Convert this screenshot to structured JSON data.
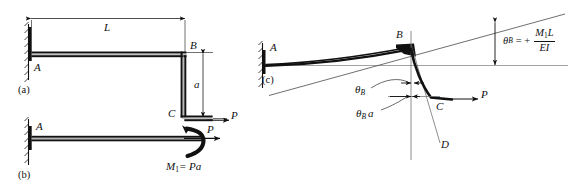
{
  "figure": {
    "kind": "engineering-beam-deflection-diagram",
    "background_color": "#ffffff",
    "ink_color": "#111111",
    "thin_color": "#6a6a6a"
  },
  "panels": [
    {
      "id": "a",
      "label": "(a)"
    },
    {
      "id": "b",
      "label": "(b)"
    },
    {
      "id": "c",
      "label": "(c)"
    }
  ],
  "panel_a": {
    "label": "(a)",
    "support_label": "A",
    "corner_label": "B",
    "tip_label": "C",
    "span_dimension": "L",
    "height_dimension": "a",
    "force_label": "P"
  },
  "panel_b": {
    "label": "(b)",
    "support_label": "A",
    "force_label": "P",
    "moment_label_main": "M",
    "moment_label_sub": "1",
    "moment_label_rest": "= Pa",
    "moment_label_full": "M1 = Pa"
  },
  "panel_c": {
    "label": "(c)",
    "support_label": "A",
    "corner_label": "B",
    "tip_label": "C",
    "projection_label": "D",
    "force_label": "P",
    "angle_label": "θ",
    "angle_sub": "B",
    "angle_label_full": "θB",
    "offset_label_full": "θB a",
    "offset_suffix": "a",
    "formula": {
      "theta": "θ",
      "theta_sub": "B",
      "equals": "= +",
      "numerator_m": "M",
      "numerator_m_sub": "1",
      "numerator_l": "L",
      "denominator": "EI",
      "full": "θB = + M1L / EI"
    }
  }
}
